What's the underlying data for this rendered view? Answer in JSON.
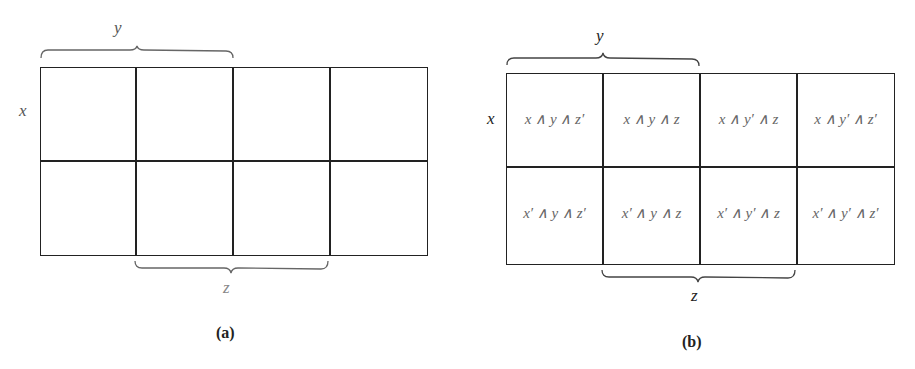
{
  "diagram_a": {
    "caption": "(a)",
    "row_label": "x",
    "top_brace_label": "y",
    "bottom_brace_label": "z"
  },
  "diagram_b": {
    "caption": "(b)",
    "row_label": "x",
    "top_brace_label": "y",
    "bottom_brace_label": "z",
    "cells": [
      [
        "x ∧ y ∧ z′",
        "x ∧ y ∧ z",
        "x ∧ y′ ∧ z",
        "x ∧ y′ ∧ z′"
      ],
      [
        "x′ ∧ y ∧ z′",
        "x′ ∧ y ∧ z",
        "x′ ∧ y′ ∧ z",
        "x′ ∧ y′ ∧ z′"
      ]
    ]
  }
}
